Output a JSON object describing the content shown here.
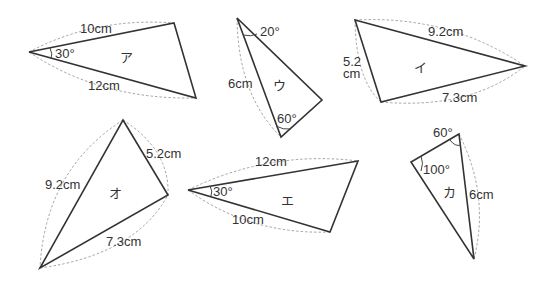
{
  "triangles": {
    "a": {
      "name": "ア",
      "side1": "10cm",
      "side2": "12cm",
      "angle": "30°"
    },
    "u": {
      "name": "ウ",
      "side": "6cm",
      "angle1": "20°",
      "angle2": "60°"
    },
    "i": {
      "name": "イ",
      "side1": "9.2cm",
      "side2_line1": "5.2",
      "side2_line2": "cm",
      "side3": "7.3cm"
    },
    "o": {
      "name": "オ",
      "side1": "9.2cm",
      "side2": "5.2cm",
      "side3": "7.3cm"
    },
    "e": {
      "name": "エ",
      "side1": "12cm",
      "side2": "10cm",
      "angle": "30°"
    },
    "ka": {
      "name": "カ",
      "side": "6cm",
      "angle1": "60°",
      "angle2": "100°"
    }
  }
}
